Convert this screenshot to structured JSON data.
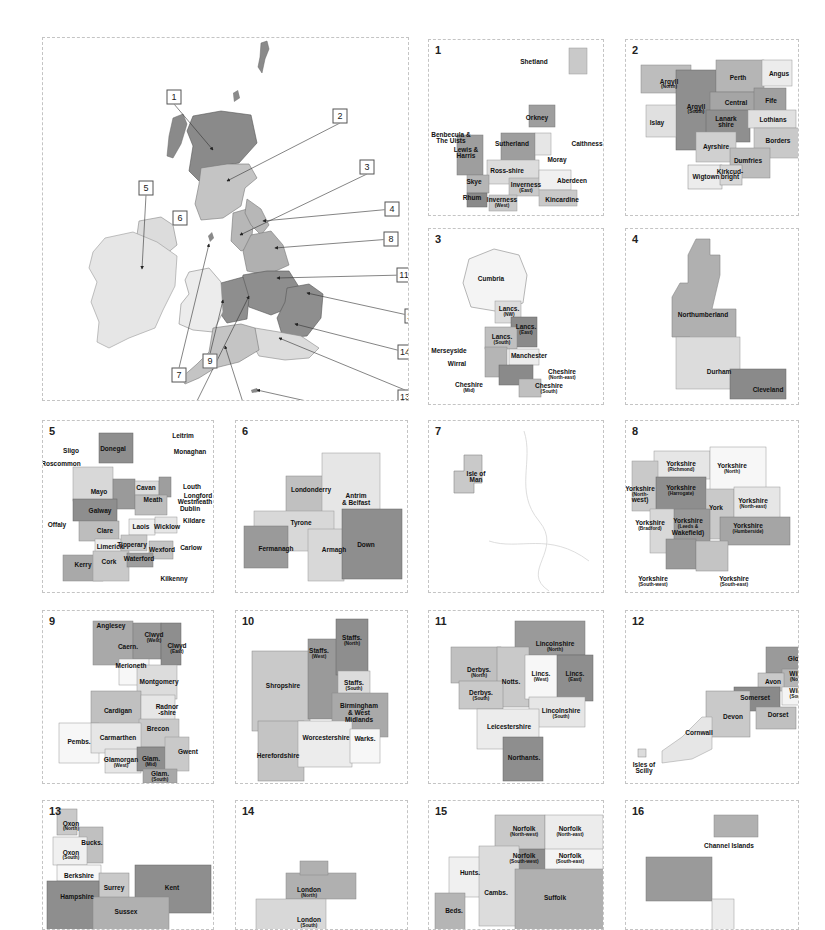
{
  "colors": {
    "dark": "#8a8a8a",
    "mid": "#a9a9a9",
    "light": "#c9c9c9",
    "pale": "#e3e3e3",
    "white": "#f7f7f7",
    "outline": "#cfcfcf"
  },
  "overview": {
    "callouts": [
      {
        "n": "1",
        "x": 131,
        "y": 59
      },
      {
        "n": "2",
        "x": 297,
        "y": 78
      },
      {
        "n": "3",
        "x": 324,
        "y": 129
      },
      {
        "n": "4",
        "x": 349,
        "y": 171
      },
      {
        "n": "5",
        "x": 103,
        "y": 150
      },
      {
        "n": "6",
        "x": 137,
        "y": 180
      },
      {
        "n": "7",
        "x": 136,
        "y": 337
      },
      {
        "n": "8",
        "x": 348,
        "y": 201
      },
      {
        "n": "9",
        "x": 167,
        "y": 323
      },
      {
        "n": "10",
        "x": 153,
        "y": 372
      },
      {
        "n": "11",
        "x": 361,
        "y": 237
      },
      {
        "n": "12",
        "x": 203,
        "y": 381
      },
      {
        "n": "13",
        "x": 362,
        "y": 359
      },
      {
        "n": "14",
        "x": 362,
        "y": 314
      },
      {
        "n": "15",
        "x": 369,
        "y": 278
      },
      {
        "n": "16",
        "x": 299,
        "y": 371
      }
    ]
  },
  "panels": [
    {
      "n": "1",
      "labels": [
        {
          "t": "Shetland",
          "x": 105,
          "y": 22
        },
        {
          "t": "Orkney",
          "x": 108,
          "y": 78
        },
        {
          "t": "Caithness",
          "x": 158,
          "y": 104
        },
        {
          "t": "Benbecula &",
          "x": 22,
          "y": 95
        },
        {
          "t": "The Uists",
          "x": 22,
          "y": 101
        },
        {
          "t": "Lewis &",
          "x": 37,
          "y": 110
        },
        {
          "t": "Harris",
          "x": 37,
          "y": 116
        },
        {
          "t": "Sutherland",
          "x": 83,
          "y": 104
        },
        {
          "t": "Moray",
          "x": 128,
          "y": 120
        },
        {
          "t": "Ross-shire",
          "x": 78,
          "y": 131
        },
        {
          "t": "Skye",
          "x": 45,
          "y": 142
        },
        {
          "t": "Aberdeen",
          "x": 143,
          "y": 141
        },
        {
          "t": "Inverness",
          "x": 97,
          "y": 145
        },
        {
          "t": "(East)",
          "x": 97,
          "y": 151
        },
        {
          "t": "Rhum",
          "x": 43,
          "y": 158
        },
        {
          "t": "Inverness",
          "x": 73,
          "y": 160
        },
        {
          "t": "(West)",
          "x": 73,
          "y": 166
        },
        {
          "t": "Kincardine",
          "x": 133,
          "y": 160
        }
      ]
    },
    {
      "n": "2",
      "labels": [
        {
          "t": "Perth",
          "x": 112,
          "y": 38
        },
        {
          "t": "Angus",
          "x": 153,
          "y": 34
        },
        {
          "t": "Argyll",
          "x": 43,
          "y": 42
        },
        {
          "t": "(North)",
          "x": 43,
          "y": 47
        },
        {
          "t": "Argyll",
          "x": 70,
          "y": 67
        },
        {
          "t": "(South)",
          "x": 70,
          "y": 72
        },
        {
          "t": "Central",
          "x": 110,
          "y": 63
        },
        {
          "t": "Fife",
          "x": 145,
          "y": 61
        },
        {
          "t": "Islay",
          "x": 31,
          "y": 83
        },
        {
          "t": "Lanark",
          "x": 100,
          "y": 79
        },
        {
          "t": "shire",
          "x": 100,
          "y": 85
        },
        {
          "t": "Lothians",
          "x": 147,
          "y": 80
        },
        {
          "t": "Borders",
          "x": 152,
          "y": 101
        },
        {
          "t": "Ayrshire",
          "x": 90,
          "y": 107
        },
        {
          "t": "Dumfries",
          "x": 122,
          "y": 121
        },
        {
          "t": "Wigtown",
          "x": 80,
          "y": 137
        },
        {
          "t": "Kirkcud-",
          "x": 104,
          "y": 132
        },
        {
          "t": "bright",
          "x": 104,
          "y": 137
        }
      ]
    },
    {
      "n": "3",
      "labels": [
        {
          "t": "Cumbria",
          "x": 62,
          "y": 50
        },
        {
          "t": "Lancs.",
          "x": 80,
          "y": 80
        },
        {
          "t": "(NW)",
          "x": 80,
          "y": 86
        },
        {
          "t": "Lancs.",
          "x": 97,
          "y": 98
        },
        {
          "t": "(East)",
          "x": 97,
          "y": 104
        },
        {
          "t": "Lancs.",
          "x": 73,
          "y": 108
        },
        {
          "t": "(South)",
          "x": 73,
          "y": 114
        },
        {
          "t": "Merseyside",
          "x": 20,
          "y": 122
        },
        {
          "t": "Manchester",
          "x": 100,
          "y": 127
        },
        {
          "t": "Wirral",
          "x": 28,
          "y": 135
        },
        {
          "t": "Cheshire",
          "x": 133,
          "y": 143
        },
        {
          "t": "(North-east)",
          "x": 133,
          "y": 149
        },
        {
          "t": "Cheshire",
          "x": 40,
          "y": 156
        },
        {
          "t": "(Mid)",
          "x": 40,
          "y": 162
        },
        {
          "t": "Cheshire",
          "x": 120,
          "y": 157
        },
        {
          "t": "(South)",
          "x": 120,
          "y": 163
        }
      ]
    },
    {
      "n": "4",
      "labels": [
        {
          "t": "Northumberland",
          "x": 77,
          "y": 86
        },
        {
          "t": "Durham",
          "x": 93,
          "y": 143
        },
        {
          "t": "Cleveland",
          "x": 142,
          "y": 161
        }
      ]
    },
    {
      "n": "5",
      "labels": [
        {
          "t": "Leitrim",
          "x": 140,
          "y": 15
        },
        {
          "t": "Donegal",
          "x": 70,
          "y": 28
        },
        {
          "t": "Sligo",
          "x": 28,
          "y": 30
        },
        {
          "t": "Monaghan",
          "x": 147,
          "y": 31
        },
        {
          "t": "Roscommon",
          "x": 18,
          "y": 43
        },
        {
          "t": "Louth",
          "x": 149,
          "y": 66
        },
        {
          "t": "Mayo",
          "x": 56,
          "y": 71
        },
        {
          "t": "Cavan",
          "x": 103,
          "y": 67
        },
        {
          "t": "Longford",
          "x": 155,
          "y": 75
        },
        {
          "t": "Meath",
          "x": 110,
          "y": 79
        },
        {
          "t": "Westmeath",
          "x": 152,
          "y": 81
        },
        {
          "t": "Galway",
          "x": 57,
          "y": 90
        },
        {
          "t": "Dublin",
          "x": 147,
          "y": 88
        },
        {
          "t": "Offaly",
          "x": 14,
          "y": 104
        },
        {
          "t": "Kildare",
          "x": 151,
          "y": 100
        },
        {
          "t": "Laois",
          "x": 98,
          "y": 106
        },
        {
          "t": "Wicklow",
          "x": 124,
          "y": 106
        },
        {
          "t": "Clare",
          "x": 62,
          "y": 110
        },
        {
          "t": "Limerick",
          "x": 67,
          "y": 126
        },
        {
          "t": "Tipperary",
          "x": 89,
          "y": 124
        },
        {
          "t": "Carlow",
          "x": 148,
          "y": 127
        },
        {
          "t": "Wexford",
          "x": 119,
          "y": 129
        },
        {
          "t": "Cork",
          "x": 66,
          "y": 141
        },
        {
          "t": "Waterford",
          "x": 96,
          "y": 138
        },
        {
          "t": "Kerry",
          "x": 40,
          "y": 144
        },
        {
          "t": "Kilkenny",
          "x": 131,
          "y": 158
        }
      ]
    },
    {
      "n": "6",
      "labels": [
        {
          "t": "Londonderry",
          "x": 75,
          "y": 69
        },
        {
          "t": "Antrim",
          "x": 120,
          "y": 75
        },
        {
          "t": "& Belfast",
          "x": 120,
          "y": 82
        },
        {
          "t": "Tyrone",
          "x": 65,
          "y": 102
        },
        {
          "t": "Fermanagh",
          "x": 40,
          "y": 128
        },
        {
          "t": "Armagh",
          "x": 98,
          "y": 129
        },
        {
          "t": "Down",
          "x": 130,
          "y": 124
        }
      ]
    },
    {
      "n": "7",
      "labels": [
        {
          "t": "Isle of",
          "x": 47,
          "y": 53
        },
        {
          "t": "Man",
          "x": 47,
          "y": 59
        }
      ]
    },
    {
      "n": "8",
      "labels": [
        {
          "t": "Yorkshire",
          "x": 55,
          "y": 43
        },
        {
          "t": "(Richmond)",
          "x": 55,
          "y": 49
        },
        {
          "t": "Yorkshire",
          "x": 106,
          "y": 45
        },
        {
          "t": "(North)",
          "x": 106,
          "y": 51
        },
        {
          "t": "Yorkshire",
          "x": 55,
          "y": 67
        },
        {
          "t": "(Harrogate)",
          "x": 55,
          "y": 73
        },
        {
          "t": "Yorkshire",
          "x": 14,
          "y": 68
        },
        {
          "t": "(North-",
          "x": 14,
          "y": 74
        },
        {
          "t": "west)",
          "x": 14,
          "y": 79
        },
        {
          "t": "York",
          "x": 90,
          "y": 87
        },
        {
          "t": "Yorkshire",
          "x": 127,
          "y": 80
        },
        {
          "t": "(North-east)",
          "x": 127,
          "y": 86
        },
        {
          "t": "Yorkshire",
          "x": 24,
          "y": 102
        },
        {
          "t": "(Bradford)",
          "x": 24,
          "y": 108
        },
        {
          "t": "Yorkshire",
          "x": 62,
          "y": 100
        },
        {
          "t": "(Leeds &",
          "x": 62,
          "y": 106
        },
        {
          "t": "Wakefield)",
          "x": 62,
          "y": 112
        },
        {
          "t": "Yorkshire",
          "x": 122,
          "y": 105
        },
        {
          "t": "(Humberside)",
          "x": 122,
          "y": 111
        },
        {
          "t": "Yorkshire",
          "x": 27,
          "y": 158
        },
        {
          "t": "(South-west)",
          "x": 27,
          "y": 164
        },
        {
          "t": "Yorkshire",
          "x": 108,
          "y": 158
        },
        {
          "t": "(South-east)",
          "x": 108,
          "y": 164
        }
      ]
    },
    {
      "n": "9",
      "labels": [
        {
          "t": "Anglesey",
          "x": 68,
          "y": 15
        },
        {
          "t": "Clwyd",
          "x": 111,
          "y": 24
        },
        {
          "t": "(West)",
          "x": 111,
          "y": 30
        },
        {
          "t": "Caern.",
          "x": 85,
          "y": 36
        },
        {
          "t": "Clwyd",
          "x": 134,
          "y": 35
        },
        {
          "t": "(East)",
          "x": 134,
          "y": 41
        },
        {
          "t": "Merioneth",
          "x": 88,
          "y": 55
        },
        {
          "t": "Montgomery",
          "x": 116,
          "y": 71
        },
        {
          "t": "Cardigan",
          "x": 75,
          "y": 100
        },
        {
          "t": "Radnor",
          "x": 124,
          "y": 96
        },
        {
          "t": "-shire",
          "x": 124,
          "y": 102
        },
        {
          "t": "Brecon",
          "x": 115,
          "y": 118
        },
        {
          "t": "Pembs.",
          "x": 36,
          "y": 131
        },
        {
          "t": "Carmarthen",
          "x": 75,
          "y": 127
        },
        {
          "t": "Gwent",
          "x": 145,
          "y": 141
        },
        {
          "t": "Glamorgan",
          "x": 78,
          "y": 149
        },
        {
          "t": "(West)",
          "x": 78,
          "y": 155
        },
        {
          "t": "Glam.",
          "x": 108,
          "y": 148
        },
        {
          "t": "(Mid)",
          "x": 108,
          "y": 154
        },
        {
          "t": "Glam.",
          "x": 117,
          "y": 163
        },
        {
          "t": "(South)",
          "x": 117,
          "y": 169
        }
      ]
    },
    {
      "n": "10",
      "labels": [
        {
          "t": "Staffs.",
          "x": 116,
          "y": 27
        },
        {
          "t": "(North)",
          "x": 116,
          "y": 33
        },
        {
          "t": "Staffs.",
          "x": 83,
          "y": 40
        },
        {
          "t": "(West)",
          "x": 83,
          "y": 46
        },
        {
          "t": "Shropshire",
          "x": 47,
          "y": 75
        },
        {
          "t": "Staffs.",
          "x": 118,
          "y": 72
        },
        {
          "t": "(South)",
          "x": 118,
          "y": 78
        },
        {
          "t": "Birmingham",
          "x": 123,
          "y": 95
        },
        {
          "t": "& West",
          "x": 123,
          "y": 102
        },
        {
          "t": "Midlands",
          "x": 123,
          "y": 109
        },
        {
          "t": "Worcestershire",
          "x": 90,
          "y": 127
        },
        {
          "t": "Warks.",
          "x": 129,
          "y": 128
        },
        {
          "t": "Herefordshire",
          "x": 42,
          "y": 145
        }
      ]
    },
    {
      "n": "11",
      "labels": [
        {
          "t": "Lincolnshire",
          "x": 126,
          "y": 33
        },
        {
          "t": "(North)",
          "x": 126,
          "y": 39
        },
        {
          "t": "Derbys.",
          "x": 50,
          "y": 59
        },
        {
          "t": "(North)",
          "x": 50,
          "y": 65
        },
        {
          "t": "Lincs.",
          "x": 112,
          "y": 63
        },
        {
          "t": "(West)",
          "x": 112,
          "y": 69
        },
        {
          "t": "Lincs.",
          "x": 146,
          "y": 63
        },
        {
          "t": "(East)",
          "x": 146,
          "y": 69
        },
        {
          "t": "Notts.",
          "x": 82,
          "y": 71
        },
        {
          "t": "Derbys.",
          "x": 52,
          "y": 82
        },
        {
          "t": "(South)",
          "x": 52,
          "y": 88
        },
        {
          "t": "Lincolnshire",
          "x": 132,
          "y": 100
        },
        {
          "t": "(South)",
          "x": 132,
          "y": 106
        },
        {
          "t": "Leicestershire",
          "x": 80,
          "y": 116
        },
        {
          "t": "Northants.",
          "x": 95,
          "y": 147
        }
      ]
    },
    {
      "n": "12",
      "labels": [
        {
          "t": "Glos.",
          "x": 170,
          "y": 48
        },
        {
          "t": "Wilts.",
          "x": 172,
          "y": 63
        },
        {
          "t": "(North)",
          "x": 172,
          "y": 69
        },
        {
          "t": "Avon",
          "x": 147,
          "y": 71
        },
        {
          "t": "Wilts.",
          "x": 172,
          "y": 80
        },
        {
          "t": "(South)",
          "x": 172,
          "y": 86
        },
        {
          "t": "Somerset",
          "x": 129,
          "y": 87
        },
        {
          "t": "Devon",
          "x": 107,
          "y": 106
        },
        {
          "t": "Dorset",
          "x": 152,
          "y": 104
        },
        {
          "t": "Cornwall",
          "x": 73,
          "y": 122
        },
        {
          "t": "Isles of",
          "x": 18,
          "y": 154
        },
        {
          "t": "Scilly",
          "x": 18,
          "y": 160
        }
      ]
    },
    {
      "n": "13",
      "labels": [
        {
          "t": "Oxon",
          "x": 28,
          "y": 23
        },
        {
          "t": "(North)",
          "x": 28,
          "y": 28
        },
        {
          "t": "Bucks.",
          "x": 49,
          "y": 42
        },
        {
          "t": "Oxon",
          "x": 28,
          "y": 52
        },
        {
          "t": "(South)",
          "x": 28,
          "y": 57
        },
        {
          "t": "Berkshire",
          "x": 36,
          "y": 75
        },
        {
          "t": "Surrey",
          "x": 71,
          "y": 87
        },
        {
          "t": "Kent",
          "x": 129,
          "y": 87
        },
        {
          "t": "Hampshire",
          "x": 34,
          "y": 96
        },
        {
          "t": "Sussex",
          "x": 83,
          "y": 111
        }
      ]
    },
    {
      "n": "14",
      "labels": [
        {
          "t": "London",
          "x": 73,
          "y": 89
        },
        {
          "t": "(North)",
          "x": 73,
          "y": 95
        },
        {
          "t": "London",
          "x": 73,
          "y": 119
        },
        {
          "t": "(South)",
          "x": 73,
          "y": 125
        }
      ]
    },
    {
      "n": "15",
      "labels": [
        {
          "t": "Norfolk",
          "x": 95,
          "y": 28
        },
        {
          "t": "(North-west)",
          "x": 95,
          "y": 34
        },
        {
          "t": "Norfolk",
          "x": 141,
          "y": 28
        },
        {
          "t": "(North-east)",
          "x": 141,
          "y": 34
        },
        {
          "t": "Norfolk",
          "x": 95,
          "y": 55
        },
        {
          "t": "(South-west)",
          "x": 95,
          "y": 61
        },
        {
          "t": "Norfolk",
          "x": 141,
          "y": 55
        },
        {
          "t": "(South-east)",
          "x": 141,
          "y": 61
        },
        {
          "t": "Hunts.",
          "x": 41,
          "y": 72
        },
        {
          "t": "Cambs.",
          "x": 67,
          "y": 92
        },
        {
          "t": "Suffolk",
          "x": 126,
          "y": 97
        },
        {
          "t": "Beds.",
          "x": 25,
          "y": 110
        }
      ]
    },
    {
      "n": "16",
      "labels": [
        {
          "t": "Channel Islands",
          "x": 103,
          "y": 45
        }
      ]
    }
  ]
}
